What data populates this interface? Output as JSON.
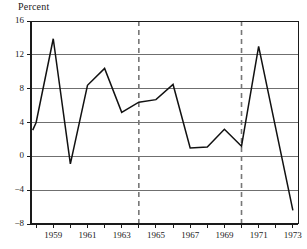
{
  "chart_data": {
    "type": "line",
    "title": "Percent",
    "ylabel": "Percent",
    "xlabel": "",
    "grid": true,
    "legend": "none",
    "ylim": [
      -8,
      16
    ],
    "xlim": [
      1957.7,
      1973.3
    ],
    "yticks": [
      16,
      12,
      8,
      4,
      0,
      -4,
      -8
    ],
    "ytick_labels": [
      "16",
      "12",
      "8",
      "4",
      "0",
      "−4",
      "−8"
    ],
    "xticks": [
      1958,
      1959,
      1960,
      1961,
      1962,
      1963,
      1964,
      1965,
      1966,
      1967,
      1968,
      1969,
      1970,
      1971,
      1972,
      1973
    ],
    "xtick_labels": [
      "1959",
      "1961",
      "1963",
      "1965",
      "1967",
      "1969",
      "1971",
      "1973"
    ],
    "xtick_label_years": [
      1959,
      1961,
      1963,
      1965,
      1967,
      1969,
      1971,
      1973
    ],
    "x": [
      1957.8,
      1958.0,
      1959.0,
      1960.0,
      1961.0,
      1962.0,
      1963.0,
      1964.0,
      1965.0,
      1966.0,
      1967.0,
      1968.0,
      1969.0,
      1970.0,
      1971.0,
      1973.0
    ],
    "values": [
      3.1,
      4.0,
      13.9,
      -0.9,
      8.4,
      10.4,
      5.2,
      6.4,
      6.7,
      8.5,
      1.0,
      1.1,
      3.2,
      1.2,
      13.0,
      -6.4
    ],
    "annotations": [
      {
        "type": "vline",
        "style": "dashed",
        "x": 1964.0
      },
      {
        "type": "vline",
        "style": "dashed",
        "x": 1970.0
      }
    ],
    "series": [
      {
        "name": "Percent",
        "x": [
          1957.8,
          1958.0,
          1959.0,
          1960.0,
          1961.0,
          1962.0,
          1963.0,
          1964.0,
          1965.0,
          1966.0,
          1967.0,
          1968.0,
          1969.0,
          1970.0,
          1971.0,
          1973.0
        ],
        "values": [
          3.1,
          4.0,
          13.9,
          -0.9,
          8.4,
          10.4,
          5.2,
          6.4,
          6.7,
          8.5,
          1.0,
          1.1,
          3.2,
          1.2,
          13.0,
          -6.4
        ]
      }
    ],
    "colors": {
      "line": "#111111",
      "grid": "#6f6f6f",
      "axis": "#1a1a1a",
      "vline": "#777777",
      "background": "#ffffff"
    }
  }
}
